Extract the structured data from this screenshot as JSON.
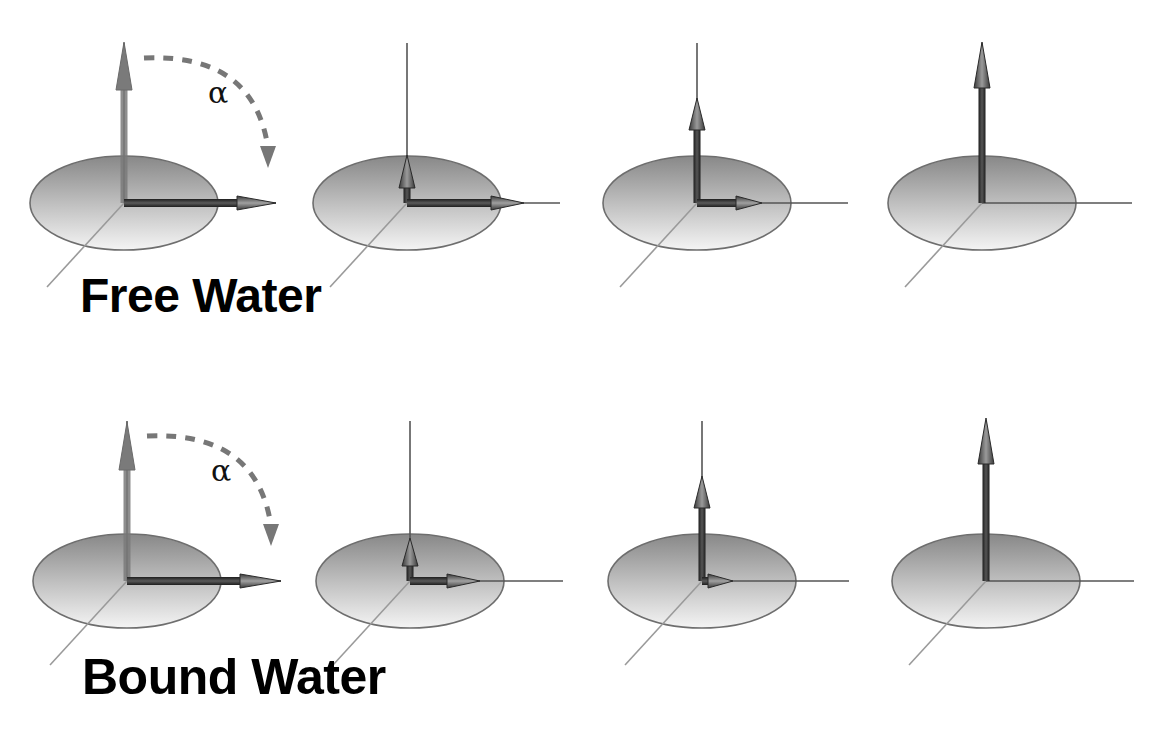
{
  "rows": [
    {
      "label": "Free Water",
      "label_pos": {
        "x": 80,
        "y": 278,
        "size": 48
      },
      "origin_y": 203,
      "angle_symbol": "α",
      "panels": [
        {
          "index": 1,
          "origin_x": 124,
          "vertical_top": 42,
          "vertical_head": 90,
          "vertical_style": "faded",
          "horizontal_end": 276,
          "horizontal_head_start": 237,
          "axis_x_end": 276,
          "shows_flip_arc": true
        },
        {
          "index": 2,
          "origin_x": 407,
          "vertical_top": 155,
          "vertical_head": 188,
          "vertical_style": "dark",
          "horizontal_end": 524,
          "horizontal_head_start": 491,
          "axis_x_end": 560,
          "shows_flip_arc": false
        },
        {
          "index": 3,
          "origin_x": 697,
          "vertical_top": 98,
          "vertical_head": 130,
          "vertical_style": "dark",
          "horizontal_end": 762,
          "horizontal_head_start": 736,
          "axis_x_end": 848,
          "shows_flip_arc": false
        },
        {
          "index": 4,
          "origin_x": 982,
          "vertical_top": 42,
          "vertical_head": 88,
          "vertical_style": "dark",
          "horizontal_end": null,
          "horizontal_head_start": null,
          "axis_x_end": 1132,
          "shows_flip_arc": false
        }
      ]
    },
    {
      "label": "Bound Water",
      "label_pos": {
        "x": 82,
        "y": 658,
        "size": 48
      },
      "origin_y": 581,
      "angle_symbol": "α",
      "panels": [
        {
          "index": 1,
          "origin_x": 127,
          "vertical_top": 422,
          "vertical_head": 470,
          "vertical_style": "faded",
          "horizontal_end": 281,
          "horizontal_head_start": 240,
          "axis_x_end": 281,
          "shows_flip_arc": true
        },
        {
          "index": 2,
          "origin_x": 410,
          "vertical_top": 538,
          "vertical_head": 566,
          "vertical_style": "dark",
          "horizontal_end": 480,
          "horizontal_head_start": 447,
          "axis_x_end": 563,
          "shows_flip_arc": false
        },
        {
          "index": 3,
          "origin_x": 702,
          "vertical_top": 476,
          "vertical_head": 508,
          "vertical_style": "dark",
          "horizontal_end": 733,
          "horizontal_head_start": 708,
          "axis_x_end": 849,
          "shows_flip_arc": false
        },
        {
          "index": 4,
          "origin_x": 986,
          "vertical_top": 418,
          "vertical_head": 464,
          "vertical_style": "dark",
          "horizontal_end": null,
          "horizontal_head_start": null,
          "axis_x_end": 1134,
          "shows_flip_arc": false
        }
      ]
    }
  ],
  "geometry": {
    "ellipse_rx": 94,
    "ellipse_ry": 47,
    "z_axis_height": 160,
    "diag_dx": -77,
    "diag_dy": 84
  },
  "colors": {
    "background": "#ffffff",
    "ellipse_dark": "#8a8a8a",
    "ellipse_light": "#f2f2f2",
    "ellipse_stroke": "#6e6e6e",
    "axis_line": "#555555",
    "diag_line": "#9a9a9a",
    "arrow_dark": "#2e2e2e",
    "arrow_faded": "#7a7a7a",
    "arc_dashed": "#777777",
    "text": "#000000"
  }
}
